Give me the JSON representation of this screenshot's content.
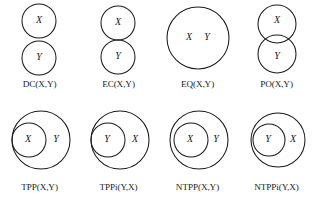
{
  "figure": {
    "background_color": "#ffffff",
    "stroke_color": "#1a1a1a",
    "text_color": "#1b1b1b"
  },
  "labels": {
    "x": "X",
    "y": "Y"
  },
  "panels": [
    {
      "id": "dc",
      "caption": "DC(X,Y)",
      "relation": "disconnected",
      "shapes": [
        {
          "name": "circle-x",
          "cx": 39,
          "cy": 21,
          "r": 17
        },
        {
          "name": "circle-y",
          "cx": 39,
          "cy": 58,
          "r": 17
        }
      ],
      "texts": [
        {
          "name": "label-x",
          "value": "X",
          "x": 39,
          "y": 21
        },
        {
          "name": "label-y",
          "value": "Y",
          "x": 39,
          "y": 58
        }
      ]
    },
    {
      "id": "ec",
      "caption": "EC(X,Y)",
      "relation": "externally-connected",
      "shapes": [
        {
          "name": "circle-x",
          "cx": 39,
          "cy": 23,
          "r": 17
        },
        {
          "name": "circle-y",
          "cx": 39,
          "cy": 57,
          "r": 17
        }
      ],
      "texts": [
        {
          "name": "label-x",
          "value": "X",
          "x": 39,
          "y": 23
        },
        {
          "name": "label-y",
          "value": "Y",
          "x": 39,
          "y": 57
        }
      ]
    },
    {
      "id": "eq",
      "caption": "EQ(X,Y)",
      "relation": "equal",
      "shapes": [
        {
          "name": "circle-xy",
          "cx": 40,
          "cy": 38,
          "r": 31
        }
      ],
      "texts": [
        {
          "name": "label-x",
          "value": "X",
          "x": 31,
          "y": 38
        },
        {
          "name": "label-y",
          "value": "Y",
          "x": 49,
          "y": 38
        }
      ]
    },
    {
      "id": "po",
      "caption": "PO(X,Y)",
      "relation": "partially-overlapping",
      "shapes": [
        {
          "name": "circle-x",
          "cx": 40,
          "cy": 24,
          "r": 19
        },
        {
          "name": "circle-y",
          "cx": 40,
          "cy": 54,
          "r": 19
        }
      ],
      "texts": [
        {
          "name": "label-x",
          "value": "X",
          "x": 40,
          "y": 21
        },
        {
          "name": "label-y",
          "value": "Y",
          "x": 40,
          "y": 57
        }
      ]
    },
    {
      "id": "tpp",
      "caption": "TPP(X,Y)",
      "relation": "tangential-proper-part",
      "shapes": [
        {
          "name": "circle-outer-y",
          "cx": 41,
          "cy": 37,
          "r": 29
        },
        {
          "name": "circle-inner-x",
          "cx": 29,
          "cy": 37,
          "r": 17
        }
      ],
      "texts": [
        {
          "name": "label-x",
          "value": "X",
          "x": 28,
          "y": 37
        },
        {
          "name": "label-y",
          "value": "Y",
          "x": 56,
          "y": 37
        }
      ]
    },
    {
      "id": "tppi",
      "caption": "TPPi(Y,X)",
      "relation": "tangential-proper-part-inverse",
      "shapes": [
        {
          "name": "circle-outer-x",
          "cx": 41,
          "cy": 37,
          "r": 29
        },
        {
          "name": "circle-inner-y",
          "cx": 29,
          "cy": 37,
          "r": 17
        }
      ],
      "texts": [
        {
          "name": "label-y",
          "value": "Y",
          "x": 28,
          "y": 37
        },
        {
          "name": "label-x",
          "value": "X",
          "x": 56,
          "y": 37
        }
      ]
    },
    {
      "id": "ntpp",
      "caption": "NTPP(X,Y)",
      "relation": "non-tangential-proper-part",
      "shapes": [
        {
          "name": "circle-outer-y",
          "cx": 41,
          "cy": 37,
          "r": 29
        },
        {
          "name": "circle-inner-x",
          "cx": 33,
          "cy": 37,
          "r": 17
        }
      ],
      "texts": [
        {
          "name": "label-x",
          "value": "X",
          "x": 32,
          "y": 37
        },
        {
          "name": "label-y",
          "value": "Y",
          "x": 58,
          "y": 37
        }
      ]
    },
    {
      "id": "ntppi",
      "caption": "NTPPi(Y,X)",
      "relation": "non-tangential-proper-part-inverse",
      "shapes": [
        {
          "name": "circle-outer-x",
          "cx": 41,
          "cy": 37,
          "r": 27
        },
        {
          "name": "circle-inner-y",
          "cx": 32,
          "cy": 37,
          "r": 16
        }
      ],
      "texts": [
        {
          "name": "label-y",
          "value": "Y",
          "x": 31,
          "y": 37
        },
        {
          "name": "label-x",
          "value": "X",
          "x": 56,
          "y": 37
        }
      ]
    }
  ],
  "layout": {
    "columns": 4,
    "rows": 2,
    "panel_width": 79,
    "panel_height": 103,
    "row_tops": [
      0,
      103
    ],
    "column_lefts": [
      0,
      79,
      158,
      237
    ]
  }
}
